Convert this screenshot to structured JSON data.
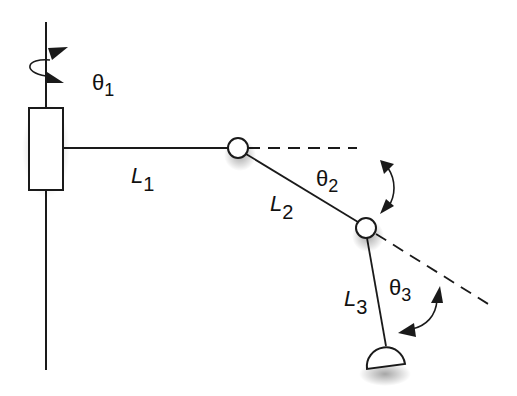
{
  "diagram": {
    "colors": {
      "stroke": "#1a1a1a",
      "background": "#ffffff",
      "fill": "#ffffff"
    },
    "labels": {
      "theta1": {
        "sym": "θ",
        "sub": "1"
      },
      "theta2": {
        "sym": "θ",
        "sub": "2"
      },
      "theta3": {
        "sym": "θ",
        "sub": "3"
      },
      "L1": {
        "sym": "L",
        "sub": "1"
      },
      "L2": {
        "sym": "L",
        "sub": "2"
      },
      "L3": {
        "sym": "L",
        "sub": "3"
      }
    },
    "components": [
      "base-axis",
      "rotary-joint-1",
      "link-L1",
      "joint-2",
      "link-L2",
      "joint-3",
      "link-L3",
      "end-effector"
    ]
  }
}
